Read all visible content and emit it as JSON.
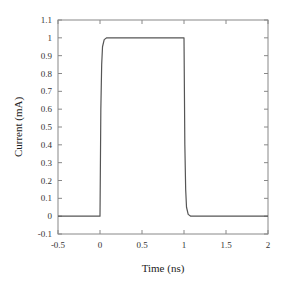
{
  "chart_data": {
    "type": "line",
    "title": "",
    "xlabel": "Time (ns)",
    "ylabel": "Current (mA)",
    "xlim": [
      -0.5,
      2
    ],
    "ylim": [
      -0.1,
      1.1
    ],
    "xticks": [
      -0.5,
      0,
      0.5,
      1,
      1.5,
      2
    ],
    "xtick_labels": [
      "-0.5",
      "0",
      "0.5",
      "1",
      "1.5",
      "2"
    ],
    "yticks": [
      -0.1,
      0,
      0.1,
      0.2,
      0.3,
      0.4,
      0.5,
      0.6,
      0.7,
      0.8,
      0.9,
      1,
      1.1
    ],
    "ytick_labels": [
      "-0.1",
      "0",
      "0.1",
      "0.2",
      "0.3",
      "0.4",
      "0.5",
      "0.6",
      "0.7",
      "0.8",
      "0.9",
      "1",
      "1.1"
    ],
    "grid": false,
    "legend": null,
    "series": [
      {
        "name": "current",
        "color": "#555555",
        "x": [
          -0.5,
          0,
          0.01,
          0.02,
          0.03,
          0.05,
          0.08,
          1.0,
          1.01,
          1.02,
          1.03,
          1.05,
          1.08,
          2
        ],
        "y": [
          0,
          0,
          0.6,
          0.85,
          0.95,
          0.99,
          1.0,
          1.0,
          0.4,
          0.15,
          0.05,
          0.01,
          0,
          0
        ]
      }
    ]
  }
}
